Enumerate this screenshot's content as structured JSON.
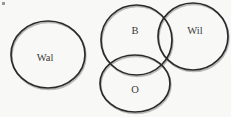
{
  "figure": {
    "background_color": "#f8f8f6",
    "stroke_color": "#2b2b2b",
    "shadow_stroke_color": "#b9b9b9",
    "label_color": "#3a3a3a",
    "width": 231,
    "height": 117
  },
  "chart_data": {
    "type": "diagram",
    "subtype": "venn",
    "title": "",
    "background": "#f8f8f6",
    "shapes": [
      {
        "id": "wal",
        "label": "Wal",
        "kind": "ellipse",
        "cx": 48,
        "cy": 54.5,
        "rx": 37,
        "ry": 33.5,
        "label_x": 45,
        "label_y": 59,
        "font_size": 10.5,
        "overlaps": []
      },
      {
        "id": "b",
        "label": "B",
        "kind": "ellipse",
        "cx": 136.5,
        "cy": 40,
        "rx": 35.5,
        "ry": 35,
        "label_x": 135,
        "label_y": 32,
        "font_size": 10.5,
        "overlaps": [
          "wil",
          "o"
        ]
      },
      {
        "id": "wil",
        "label": "Wil",
        "kind": "ellipse",
        "cx": 193,
        "cy": 36.5,
        "rx": 35,
        "ry": 33.5,
        "label_x": 195,
        "label_y": 32,
        "font_size": 10.5,
        "overlaps": [
          "b",
          "o"
        ]
      },
      {
        "id": "o",
        "label": "O",
        "kind": "ellipse",
        "cx": 135,
        "cy": 83.5,
        "rx": 35,
        "ry": 28.5,
        "label_x": 135,
        "label_y": 91,
        "font_size": 10.5,
        "overlaps": [
          "b",
          "wil"
        ]
      }
    ],
    "groups": [
      {
        "name": "isolated",
        "members": [
          "wal"
        ]
      },
      {
        "name": "intersecting-cluster",
        "members": [
          "b",
          "wil",
          "o"
        ]
      }
    ],
    "legend": null,
    "axes": null,
    "grid": false
  },
  "artifacts": {
    "speck": {
      "x": 2,
      "y": 2,
      "w": 3,
      "h": 3
    }
  }
}
